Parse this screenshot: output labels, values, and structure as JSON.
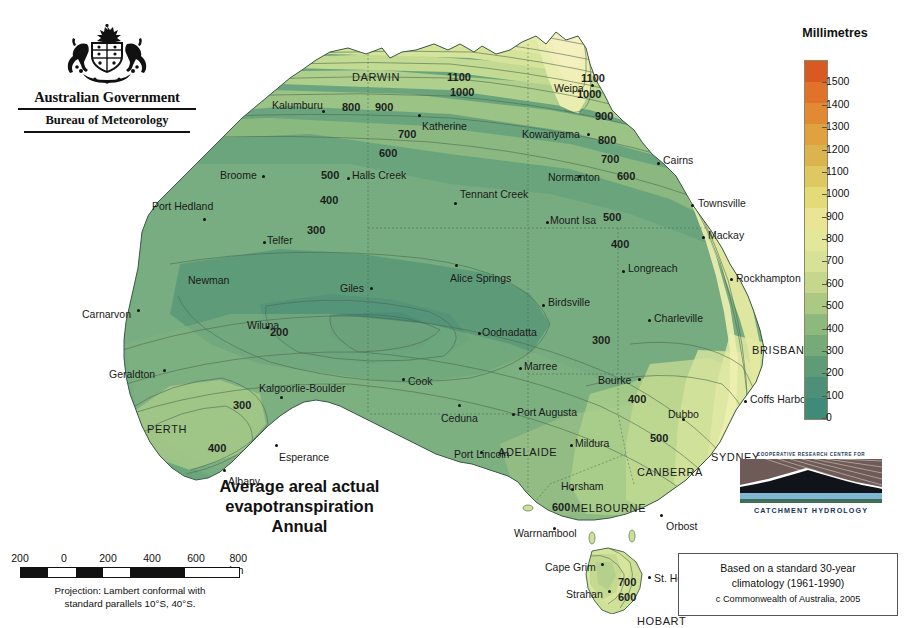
{
  "logo": {
    "government": "Australian Government",
    "bureau": "Bureau of Meteorology",
    "crest_name": "australian-coat-of-arms"
  },
  "title": {
    "line1": "Average areal actual",
    "line2": "evapotranspiration",
    "line3": "Annual"
  },
  "legend": {
    "title": "Millimetres",
    "unit": "mm",
    "ticks": [
      1500,
      1400,
      1300,
      1200,
      1100,
      1000,
      900,
      800,
      700,
      600,
      500,
      400,
      300,
      200,
      100,
      0
    ],
    "min": 0,
    "max": 1600,
    "colors": [
      "#d85a22",
      "#e0722a",
      "#e28a33",
      "#dfa23f",
      "#dcb44f",
      "#ddc862",
      "#e4da78",
      "#e9e595",
      "#e3e79a",
      "#d8e296",
      "#c4d78c",
      "#abc983",
      "#8dba7c",
      "#75ab78",
      "#5d9c77",
      "#4e9077",
      "#3f8a79"
    ]
  },
  "scale": {
    "labels": [
      "200",
      "0",
      "200",
      "400",
      "600",
      "800 km"
    ],
    "projection_line1": "Projection: Lambert conformal with",
    "projection_line2": "standard parallels 10°S, 40°S."
  },
  "crc": {
    "top_text": "COOPERATIVE RESEARCH CENTRE FOR",
    "bottom_text": "CATCHMENT HYDROLOGY",
    "image_name": "catchment-hydrology-landscape"
  },
  "attribution": {
    "line1": "Based on a standard 30-year",
    "line2": "climatology (1961-1990)",
    "line3": "c Commonwealth of Australia, 2005"
  },
  "chart_data": {
    "type": "heatmap",
    "title": "Average areal actual evapotranspiration Annual",
    "variable": "Areal actual evapotranspiration",
    "unit": "Millimetres",
    "period": "1961-1990",
    "projection": "Lambert conformal with standard parallels 10°S, 40°S",
    "scale_range_mm": [
      0,
      1600
    ],
    "contour_interval_mm": 100,
    "legend_position": "right",
    "contour_levels": [
      100,
      200,
      300,
      400,
      500,
      600,
      700,
      800,
      900,
      1000,
      1100,
      1200,
      1300,
      1400,
      1500
    ]
  },
  "cities": [
    {
      "name": "DARWIN",
      "capital": true,
      "x": 322,
      "y": 57,
      "dx": 0,
      "dy": 0,
      "dot": false
    },
    {
      "name": "Kalumburu",
      "capital": false,
      "x": 242,
      "y": 85,
      "dot": true,
      "dot_x": 292,
      "dot_y": 96
    },
    {
      "name": "Katherine",
      "capital": false,
      "x": 392,
      "y": 106,
      "dot": true,
      "dot_x": 388,
      "dot_y": 100
    },
    {
      "name": "Weipa",
      "capital": false,
      "x": 524,
      "y": 68,
      "dot": true,
      "dot_x": 561,
      "dot_y": 70
    },
    {
      "name": "Kowanyama",
      "capital": false,
      "x": 492,
      "y": 114,
      "dot": true,
      "dot_x": 557,
      "dot_y": 119
    },
    {
      "name": "Broome",
      "capital": false,
      "x": 190,
      "y": 155,
      "dot": true,
      "dot_x": 232,
      "dot_y": 161
    },
    {
      "name": "Halls Creek",
      "capital": false,
      "x": 322,
      "y": 155,
      "dot": true,
      "dot_x": 317,
      "dot_y": 163
    },
    {
      "name": "Normanton",
      "capital": false,
      "x": 518,
      "y": 157,
      "dot": true,
      "dot_x": 548,
      "dot_y": 161
    },
    {
      "name": "Cairns",
      "capital": false,
      "x": 633,
      "y": 140,
      "dot": true,
      "dot_x": 627,
      "dot_y": 148
    },
    {
      "name": "Port Hedland",
      "capital": false,
      "x": 122,
      "y": 186,
      "dot": true,
      "dot_x": 173,
      "dot_y": 204
    },
    {
      "name": "Tennant Creek",
      "capital": false,
      "x": 430,
      "y": 174,
      "dot": true,
      "dot_x": 424,
      "dot_y": 188
    },
    {
      "name": "Mount Isa",
      "capital": false,
      "x": 520,
      "y": 200,
      "dot": true,
      "dot_x": 516,
      "dot_y": 207
    },
    {
      "name": "Townsville",
      "capital": false,
      "x": 668,
      "y": 183,
      "dot": true,
      "dot_x": 661,
      "dot_y": 190
    },
    {
      "name": "Telfer",
      "capital": false,
      "x": 237,
      "y": 220,
      "dot": true,
      "dot_x": 233,
      "dot_y": 227
    },
    {
      "name": "Mackay",
      "capital": false,
      "x": 678,
      "y": 215,
      "dot": true,
      "dot_x": 672,
      "dot_y": 222
    },
    {
      "name": "Newman",
      "capital": false,
      "x": 158,
      "y": 260,
      "dot": false
    },
    {
      "name": "Giles",
      "capital": false,
      "x": 310,
      "y": 268,
      "dot": true,
      "dot_x": 340,
      "dot_y": 273
    },
    {
      "name": "Alice Springs",
      "capital": false,
      "x": 420,
      "y": 258,
      "dot": true,
      "dot_x": 425,
      "dot_y": 250
    },
    {
      "name": "Longreach",
      "capital": false,
      "x": 598,
      "y": 248,
      "dot": true,
      "dot_x": 592,
      "dot_y": 256
    },
    {
      "name": "Rockhampton",
      "capital": false,
      "x": 706,
      "y": 258,
      "dot": true,
      "dot_x": 700,
      "dot_y": 264
    },
    {
      "name": "Birdsville",
      "capital": false,
      "x": 518,
      "y": 282,
      "dot": true,
      "dot_x": 512,
      "dot_y": 290
    },
    {
      "name": "Carnarvon",
      "capital": false,
      "x": 52,
      "y": 294,
      "dot": true,
      "dot_x": 107,
      "dot_y": 295
    },
    {
      "name": "Wiluna",
      "capital": false,
      "x": 217,
      "y": 305,
      "dot": true,
      "dot_x": 236,
      "dot_y": 312
    },
    {
      "name": "Oodnadatta",
      "capital": false,
      "x": 452,
      "y": 312,
      "dot": true,
      "dot_x": 448,
      "dot_y": 318
    },
    {
      "name": "Charleville",
      "capital": false,
      "x": 624,
      "y": 298,
      "dot": true,
      "dot_x": 618,
      "dot_y": 305
    },
    {
      "name": "BRISBANE",
      "capital": true,
      "x": 722,
      "y": 330,
      "dot": false
    },
    {
      "name": "Marree",
      "capital": false,
      "x": 494,
      "y": 346,
      "dot": true,
      "dot_x": 489,
      "dot_y": 353
    },
    {
      "name": "Bourke",
      "capital": false,
      "x": 568,
      "y": 360,
      "dot": true,
      "dot_x": 608,
      "dot_y": 364
    },
    {
      "name": "Geraldton",
      "capital": false,
      "x": 79,
      "y": 354,
      "dot": true,
      "dot_x": 133,
      "dot_y": 355
    },
    {
      "name": "Cook",
      "capital": false,
      "x": 378,
      "y": 361,
      "dot": true,
      "dot_x": 372,
      "dot_y": 364
    },
    {
      "name": "Kalgoorlie-Boulder",
      "capital": false,
      "x": 229,
      "y": 368,
      "dot": true,
      "dot_x": 250,
      "dot_y": 382
    },
    {
      "name": "Dubbo",
      "capital": false,
      "x": 638,
      "y": 394,
      "dot": true,
      "dot_x": 652,
      "dot_y": 404
    },
    {
      "name": "Coffs Harbour",
      "capital": false,
      "x": 720,
      "y": 379,
      "dot": true,
      "dot_x": 714,
      "dot_y": 386
    },
    {
      "name": "Ceduna",
      "capital": false,
      "x": 411,
      "y": 398,
      "dot": true,
      "dot_x": 428,
      "dot_y": 390
    },
    {
      "name": "Port Augusta",
      "capital": false,
      "x": 487,
      "y": 392,
      "dot": true,
      "dot_x": 482,
      "dot_y": 399
    },
    {
      "name": "ADELAIDE",
      "capital": true,
      "x": 468,
      "y": 432,
      "dot": false
    },
    {
      "name": "Mildura",
      "capital": false,
      "x": 545,
      "y": 423,
      "dot": true,
      "dot_x": 540,
      "dot_y": 430
    },
    {
      "name": "PERTH",
      "capital": true,
      "x": 117,
      "y": 409,
      "dot": false
    },
    {
      "name": "SYDNEY",
      "capital": true,
      "x": 681,
      "y": 437,
      "dot": false
    },
    {
      "name": "CANBERRA",
      "capital": true,
      "x": 607,
      "y": 452,
      "dot": false
    },
    {
      "name": "Esperance",
      "capital": false,
      "x": 249,
      "y": 437,
      "dot": true,
      "dot_x": 245,
      "dot_y": 430
    },
    {
      "name": "Port Lincoln",
      "capital": false,
      "x": 424,
      "y": 434,
      "dot": true,
      "dot_x": 450,
      "dot_y": 437
    },
    {
      "name": "Albany",
      "capital": false,
      "x": 198,
      "y": 461,
      "dot": true,
      "dot_x": 193,
      "dot_y": 455
    },
    {
      "name": "Horsham",
      "capital": false,
      "x": 531,
      "y": 466,
      "dot": true,
      "dot_x": 541,
      "dot_y": 474
    },
    {
      "name": "MELBOURNE",
      "capital": true,
      "x": 541,
      "y": 488,
      "dot": false
    },
    {
      "name": "Orbost",
      "capital": false,
      "x": 636,
      "y": 506,
      "dot": true,
      "dot_x": 630,
      "dot_y": 500
    },
    {
      "name": "Warrnambool",
      "capital": false,
      "x": 484,
      "y": 513,
      "dot": true,
      "dot_x": 523,
      "dot_y": 513
    },
    {
      "name": "Cape Grim",
      "capital": false,
      "x": 515,
      "y": 547,
      "dot": true,
      "dot_x": 571,
      "dot_y": 549
    },
    {
      "name": "St. Helens",
      "capital": false,
      "x": 624,
      "y": 558,
      "dot": true,
      "dot_x": 618,
      "dot_y": 562
    },
    {
      "name": "Strahan",
      "capital": false,
      "x": 536,
      "y": 574,
      "dot": true,
      "dot_x": 578,
      "dot_y": 576
    },
    {
      "name": "HOBART",
      "capital": true,
      "x": 607,
      "y": 601,
      "dot": false
    }
  ],
  "contour_labels": [
    {
      "value": "1100",
      "x": 417,
      "y": 57
    },
    {
      "value": "1000",
      "x": 420,
      "y": 72
    },
    {
      "value": "900",
      "x": 345,
      "y": 87
    },
    {
      "value": "800",
      "x": 312,
      "y": 87
    },
    {
      "value": "700",
      "x": 368,
      "y": 114
    },
    {
      "value": "600",
      "x": 349,
      "y": 133
    },
    {
      "value": "500",
      "x": 291,
      "y": 155
    },
    {
      "value": "400",
      "x": 290,
      "y": 180
    },
    {
      "value": "300",
      "x": 277,
      "y": 210
    },
    {
      "value": "200",
      "x": 240,
      "y": 312
    },
    {
      "value": "1100",
      "x": 551,
      "y": 58
    },
    {
      "value": "1000",
      "x": 547,
      "y": 74
    },
    {
      "value": "900",
      "x": 565,
      "y": 96
    },
    {
      "value": "800",
      "x": 568,
      "y": 120
    },
    {
      "value": "700",
      "x": 571,
      "y": 139
    },
    {
      "value": "600",
      "x": 587,
      "y": 156
    },
    {
      "value": "500",
      "x": 573,
      "y": 197
    },
    {
      "value": "400",
      "x": 581,
      "y": 224
    },
    {
      "value": "300",
      "x": 562,
      "y": 320
    },
    {
      "value": "400",
      "x": 598,
      "y": 379
    },
    {
      "value": "500",
      "x": 620,
      "y": 418
    },
    {
      "value": "300",
      "x": 203,
      "y": 385
    },
    {
      "value": "400",
      "x": 178,
      "y": 428
    },
    {
      "value": "600",
      "x": 522,
      "y": 487
    },
    {
      "value": "700",
      "x": 588,
      "y": 562
    },
    {
      "value": "600",
      "x": 588,
      "y": 577
    }
  ]
}
